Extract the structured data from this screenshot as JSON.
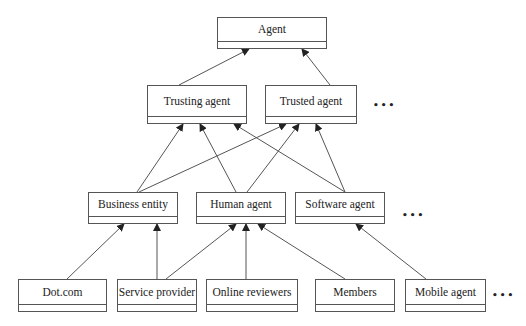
{
  "diagram": {
    "type": "class-hierarchy",
    "nodes": [
      {
        "id": "agent",
        "label": "Agent",
        "level": 0,
        "x": 217,
        "y": 17,
        "w": 110,
        "h": 32
      },
      {
        "id": "trusting-agent",
        "label": "Trusting agent",
        "level": 1,
        "x": 147,
        "y": 85,
        "w": 100,
        "h": 39
      },
      {
        "id": "trusted-agent",
        "label": "Trusted agent",
        "level": 1,
        "x": 265,
        "y": 85,
        "w": 92,
        "h": 39
      },
      {
        "id": "business-entity",
        "label": "Business entity",
        "level": 2,
        "x": 88,
        "y": 192,
        "w": 90,
        "h": 32
      },
      {
        "id": "human-agent",
        "label": "Human agent",
        "level": 2,
        "x": 196,
        "y": 192,
        "w": 90,
        "h": 32
      },
      {
        "id": "software-agent",
        "label": "Software agent",
        "level": 2,
        "x": 295,
        "y": 192,
        "w": 90,
        "h": 32
      },
      {
        "id": "dot-com",
        "label": "Dot.com",
        "level": 3,
        "x": 18,
        "y": 279,
        "w": 89,
        "h": 33
      },
      {
        "id": "service-provider",
        "label": "Service provider",
        "level": 3,
        "x": 117,
        "y": 279,
        "w": 80,
        "h": 33
      },
      {
        "id": "online-reviewers",
        "label": "Online reviewers",
        "level": 3,
        "x": 206,
        "y": 279,
        "w": 92,
        "h": 33
      },
      {
        "id": "members",
        "label": "Members",
        "level": 3,
        "x": 315,
        "y": 279,
        "w": 80,
        "h": 33
      },
      {
        "id": "mobile-agent",
        "label": "Mobile agent",
        "level": 3,
        "x": 405,
        "y": 279,
        "w": 81,
        "h": 33
      }
    ],
    "ellipses": [
      {
        "id": "ellipsis-level-1",
        "text": "•••",
        "x": 373,
        "y": 100
      },
      {
        "id": "ellipsis-level-2",
        "text": "•••",
        "x": 402,
        "y": 210
      },
      {
        "id": "ellipsis-level-3",
        "text": "•••",
        "x": 492,
        "y": 290
      }
    ],
    "edges": [
      {
        "from": "trusting-agent",
        "to": "agent",
        "x1": 179,
        "y1": 85,
        "x2": 249,
        "y2": 49
      },
      {
        "from": "trusted-agent",
        "to": "agent",
        "x1": 330,
        "y1": 85,
        "x2": 302,
        "y2": 49
      },
      {
        "from": "business-entity",
        "to": "trusting-agent",
        "x1": 137,
        "y1": 192,
        "x2": 183,
        "y2": 124
      },
      {
        "from": "business-entity",
        "to": "trusted-agent",
        "x1": 139,
        "y1": 192,
        "x2": 286,
        "y2": 124
      },
      {
        "from": "human-agent",
        "to": "trusting-agent",
        "x1": 236,
        "y1": 192,
        "x2": 200,
        "y2": 124
      },
      {
        "from": "human-agent",
        "to": "trusted-agent",
        "x1": 247,
        "y1": 192,
        "x2": 299,
        "y2": 124
      },
      {
        "from": "software-agent",
        "to": "trusting-agent",
        "x1": 345,
        "y1": 192,
        "x2": 234,
        "y2": 124
      },
      {
        "from": "software-agent",
        "to": "trusted-agent",
        "x1": 345,
        "y1": 192,
        "x2": 316,
        "y2": 124
      },
      {
        "from": "dot-com",
        "to": "business-entity",
        "x1": 67,
        "y1": 279,
        "x2": 124,
        "y2": 224
      },
      {
        "from": "service-provider",
        "to": "business-entity",
        "x1": 157,
        "y1": 279,
        "x2": 157,
        "y2": 224
      },
      {
        "from": "service-provider",
        "to": "human-agent",
        "x1": 166,
        "y1": 279,
        "x2": 236,
        "y2": 224
      },
      {
        "from": "online-reviewers",
        "to": "human-agent",
        "x1": 246,
        "y1": 279,
        "x2": 246,
        "y2": 224
      },
      {
        "from": "members",
        "to": "human-agent",
        "x1": 345,
        "y1": 279,
        "x2": 258,
        "y2": 224
      },
      {
        "from": "mobile-agent",
        "to": "software-agent",
        "x1": 426,
        "y1": 279,
        "x2": 356,
        "y2": 224
      }
    ],
    "colors": {
      "stroke": "#555555",
      "text": "#222222",
      "background": "#ffffff"
    }
  }
}
